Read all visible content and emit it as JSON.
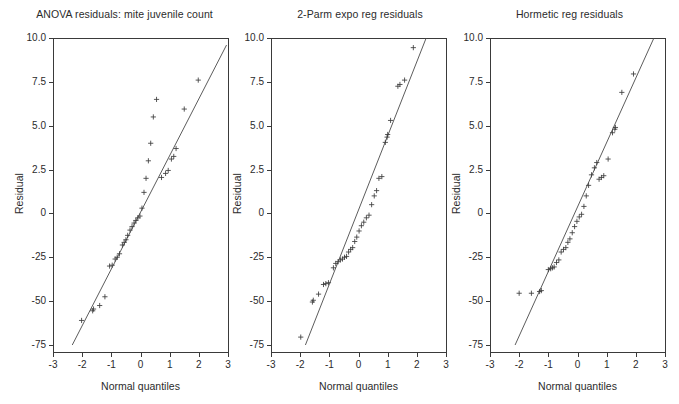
{
  "figure": {
    "width": 679,
    "height": 404,
    "background": "#ffffff",
    "line_color": "#4a4a4a",
    "marker_color": "#3c3c3c",
    "axis_color": "#3a3a3a",
    "panel_count": 3
  },
  "chart_data": [
    {
      "type": "scatter",
      "title": "ANOVA residuals: mite juvenile count",
      "xlabel": "Normal quantiles",
      "ylabel": "Residual",
      "grid": false,
      "legend": "none",
      "xlim": [
        -3,
        3
      ],
      "xticks": [
        -3,
        -2,
        -1,
        0,
        1,
        2,
        3
      ],
      "xticklabels": [
        "-3",
        "-2",
        "-1",
        "0",
        "1",
        "2",
        "3"
      ],
      "ytickvalues": [
        10.0,
        7.5,
        5.0,
        2.5,
        0,
        -25,
        -50,
        -75
      ],
      "yticklabels": [
        "10.0",
        "7.5",
        "5.0",
        "2.5",
        "0",
        "-25",
        "-50",
        "-75"
      ],
      "reference_line": {
        "x1": -2.34,
        "y1": -75.0,
        "x2": 2.95,
        "y2": 9.6
      },
      "points": [
        {
          "x": -2.02,
          "y": -61.0
        },
        {
          "x": -1.64,
          "y": -55.5
        },
        {
          "x": -1.61,
          "y": -54.5
        },
        {
          "x": -1.4,
          "y": -52.5
        },
        {
          "x": -1.22,
          "y": -47.5
        },
        {
          "x": -1.06,
          "y": -30.0
        },
        {
          "x": -0.97,
          "y": -29.5
        },
        {
          "x": -0.87,
          "y": -26.0
        },
        {
          "x": -0.8,
          "y": -25.0
        },
        {
          "x": -0.72,
          "y": -23.0
        },
        {
          "x": -0.62,
          "y": -18.0
        },
        {
          "x": -0.56,
          "y": -16.5
        },
        {
          "x": -0.5,
          "y": -15.0
        },
        {
          "x": -0.44,
          "y": -12.5
        },
        {
          "x": -0.36,
          "y": -9.5
        },
        {
          "x": -0.29,
          "y": -7.5
        },
        {
          "x": -0.22,
          "y": -5.5
        },
        {
          "x": -0.16,
          "y": -4.0
        },
        {
          "x": -0.09,
          "y": -2.5
        },
        {
          "x": -0.02,
          "y": -1.5
        },
        {
          "x": 0.05,
          "y": 0.3
        },
        {
          "x": 0.12,
          "y": 1.2
        },
        {
          "x": 0.19,
          "y": 2.0
        },
        {
          "x": 0.27,
          "y": 3.0
        },
        {
          "x": 0.35,
          "y": 4.0
        },
        {
          "x": 0.44,
          "y": 5.5
        },
        {
          "x": 0.55,
          "y": 6.5
        },
        {
          "x": 0.72,
          "y": 2.05
        },
        {
          "x": 0.86,
          "y": 2.28
        },
        {
          "x": 0.95,
          "y": 2.45
        },
        {
          "x": 1.06,
          "y": 3.1
        },
        {
          "x": 1.14,
          "y": 3.25
        },
        {
          "x": 1.22,
          "y": 3.7
        },
        {
          "x": 1.5,
          "y": 5.95
        },
        {
          "x": 1.98,
          "y": 7.6
        }
      ]
    },
    {
      "type": "scatter",
      "title": "2-Parm expo reg residuals",
      "xlabel": "Normal quantiles",
      "ylabel": "Residual",
      "grid": false,
      "legend": "none",
      "xlim": [
        -3,
        3
      ],
      "xticks": [
        -3,
        -2,
        -1,
        0,
        1,
        2,
        3
      ],
      "xticklabels": [
        "-3",
        "-2",
        "-1",
        "0",
        "1",
        "2",
        "3"
      ],
      "ytickvalues": [
        10.0,
        7.5,
        5.0,
        2.5,
        0,
        -25,
        -50,
        -75
      ],
      "yticklabels": [
        "10.0",
        "7.5",
        "5.0",
        "2.5",
        "0",
        "-25",
        "-50",
        "-75"
      ],
      "reference_line": {
        "x1": -1.82,
        "y1": -75.0,
        "x2": 2.32,
        "y2": 10.0
      },
      "points": [
        {
          "x": -1.98,
          "y": -70.5
        },
        {
          "x": -1.58,
          "y": -50.5
        },
        {
          "x": -1.55,
          "y": -49.5
        },
        {
          "x": -1.37,
          "y": -46.0
        },
        {
          "x": -1.2,
          "y": -40.5
        },
        {
          "x": -1.12,
          "y": -40.0
        },
        {
          "x": -1.03,
          "y": -39.5
        },
        {
          "x": -0.86,
          "y": -31.0
        },
        {
          "x": -0.78,
          "y": -28.5
        },
        {
          "x": -0.7,
          "y": -27.5
        },
        {
          "x": -0.62,
          "y": -26.5
        },
        {
          "x": -0.55,
          "y": -26.0
        },
        {
          "x": -0.48,
          "y": -25.0
        },
        {
          "x": -0.41,
          "y": -24.5
        },
        {
          "x": -0.34,
          "y": -22.0
        },
        {
          "x": -0.27,
          "y": -20.5
        },
        {
          "x": -0.2,
          "y": -19.5
        },
        {
          "x": -0.13,
          "y": -16.0
        },
        {
          "x": -0.06,
          "y": -13.5
        },
        {
          "x": 0.02,
          "y": -10.0
        },
        {
          "x": 0.1,
          "y": -7.0
        },
        {
          "x": 0.18,
          "y": -5.0
        },
        {
          "x": 0.27,
          "y": -2.5
        },
        {
          "x": 0.36,
          "y": -1.0
        },
        {
          "x": 0.45,
          "y": 0.5
        },
        {
          "x": 0.54,
          "y": 1.0
        },
        {
          "x": 0.62,
          "y": 1.3
        },
        {
          "x": 0.7,
          "y": 2.0
        },
        {
          "x": 0.8,
          "y": 2.1
        },
        {
          "x": 0.92,
          "y": 4.05
        },
        {
          "x": 0.98,
          "y": 4.35
        },
        {
          "x": 1.0,
          "y": 4.5
        },
        {
          "x": 1.1,
          "y": 5.3
        },
        {
          "x": 1.35,
          "y": 7.25
        },
        {
          "x": 1.42,
          "y": 7.35
        },
        {
          "x": 1.58,
          "y": 7.6
        },
        {
          "x": 1.88,
          "y": 9.45
        }
      ]
    },
    {
      "type": "scatter",
      "title": "Hormetic reg residuals",
      "xlabel": "Normal quantiles",
      "ylabel": "Residual",
      "grid": false,
      "legend": "none",
      "xlim": [
        -3,
        3
      ],
      "xticks": [
        -3,
        -2,
        -1,
        0,
        1,
        2,
        3
      ],
      "xticklabels": [
        "-3",
        "-2",
        "-1",
        "0",
        "1",
        "2",
        "3"
      ],
      "ytickvalues": [
        10.0,
        7.5,
        5.0,
        2.5,
        0,
        -25,
        -50,
        -75
      ],
      "yticklabels": [
        "10.0",
        "7.5",
        "5.0",
        "2.5",
        "0",
        "-25",
        "-50",
        "-75"
      ],
      "reference_line": {
        "x1": -2.14,
        "y1": -75.0,
        "x2": 2.62,
        "y2": 10.0
      },
      "points": [
        {
          "x": -2.0,
          "y": -45.5
        },
        {
          "x": -1.58,
          "y": -45.5
        },
        {
          "x": -1.3,
          "y": -44.5
        },
        {
          "x": -1.24,
          "y": -44.0
        },
        {
          "x": -1.0,
          "y": -32.0
        },
        {
          "x": -0.92,
          "y": -31.5
        },
        {
          "x": -0.86,
          "y": -31.0
        },
        {
          "x": -0.8,
          "y": -30.5
        },
        {
          "x": -0.72,
          "y": -28.0
        },
        {
          "x": -0.64,
          "y": -26.5
        },
        {
          "x": -0.56,
          "y": -22.0
        },
        {
          "x": -0.48,
          "y": -20.5
        },
        {
          "x": -0.4,
          "y": -19.5
        },
        {
          "x": -0.33,
          "y": -16.5
        },
        {
          "x": -0.26,
          "y": -14.5
        },
        {
          "x": -0.18,
          "y": -11.0
        },
        {
          "x": -0.1,
          "y": -7.5
        },
        {
          "x": -0.02,
          "y": -4.5
        },
        {
          "x": 0.06,
          "y": -2.0
        },
        {
          "x": 0.14,
          "y": -0.5
        },
        {
          "x": 0.22,
          "y": 0.4
        },
        {
          "x": 0.3,
          "y": 1.0
        },
        {
          "x": 0.38,
          "y": 1.6
        },
        {
          "x": 0.48,
          "y": 2.2
        },
        {
          "x": 0.58,
          "y": 2.6
        },
        {
          "x": 0.66,
          "y": 2.9
        },
        {
          "x": 0.74,
          "y": 1.95
        },
        {
          "x": 0.82,
          "y": 2.05
        },
        {
          "x": 0.9,
          "y": 2.15
        },
        {
          "x": 1.05,
          "y": 3.1
        },
        {
          "x": 1.2,
          "y": 4.6
        },
        {
          "x": 1.28,
          "y": 4.8
        },
        {
          "x": 1.3,
          "y": 4.9
        },
        {
          "x": 1.52,
          "y": 6.9
        },
        {
          "x": 1.92,
          "y": 7.95
        }
      ]
    }
  ]
}
